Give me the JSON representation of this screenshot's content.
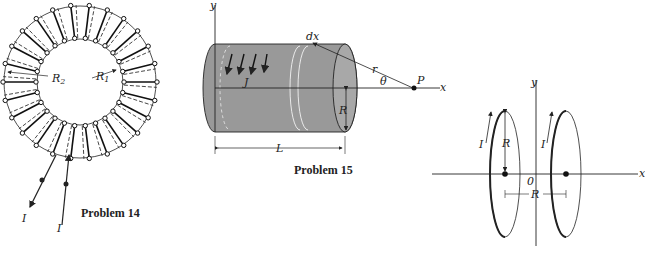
{
  "problems": [
    {
      "caption": "Problem 14",
      "figure": "toroid",
      "labels": {
        "inner_radius": "R",
        "inner_radius_sub": "1",
        "outer_radius": "R",
        "outer_radius_sub": "2",
        "current_out": "I",
        "current_in": "I"
      }
    },
    {
      "caption": "Problem 15",
      "figure": "cylinder",
      "labels": {
        "y_axis": "y",
        "x_axis": "x",
        "element": "dx",
        "distance": "r",
        "angle": "θ",
        "point": "P",
        "current_density": "J",
        "radius": "R",
        "length": "L"
      }
    },
    {
      "caption": "",
      "figure": "two-coaxial-loops",
      "labels": {
        "y_axis": "y",
        "x_axis": "x",
        "origin": "0",
        "radius": "R",
        "separation": "R",
        "current_left": "I",
        "current_right": "I"
      }
    }
  ]
}
